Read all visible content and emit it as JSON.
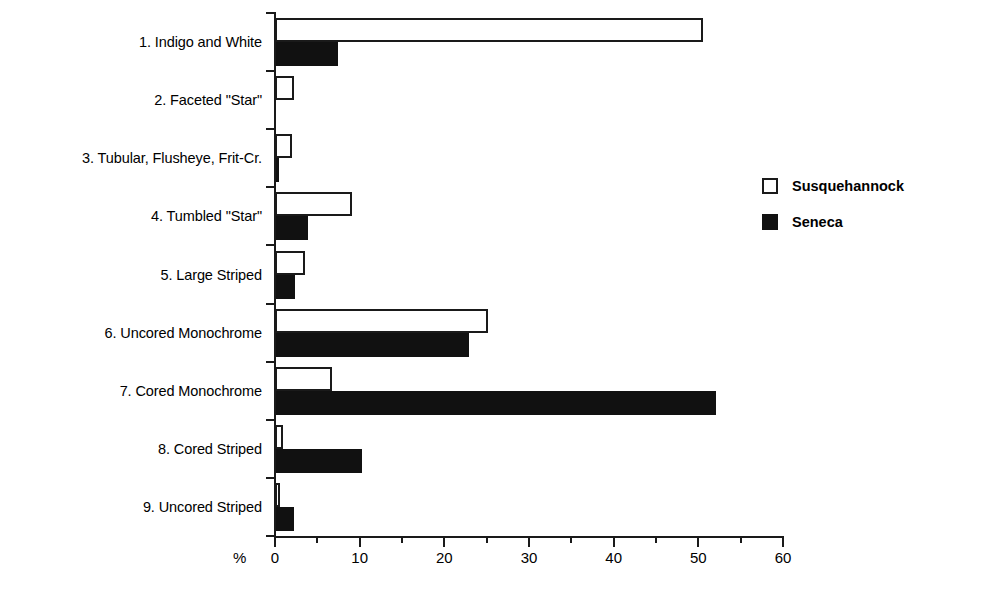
{
  "chart_data": {
    "type": "bar",
    "orientation": "horizontal",
    "title": "",
    "xlabel": "%",
    "ylabel": "",
    "xlim": [
      0,
      60
    ],
    "xticks": [
      0,
      10,
      20,
      30,
      40,
      50,
      60
    ],
    "xtick_labels": [
      "0",
      "10",
      "20",
      "30",
      "40",
      "50",
      "60"
    ],
    "minor_tick_step": 5,
    "grid": false,
    "legend_position": "right",
    "categories": [
      "1. Indigo and White",
      "2. Faceted \"Star\"",
      "3. Tubular, Flusheye, Frit-Cr.",
      "4. Tumbled \"Star\"",
      "5. Large Striped",
      "6. Uncored Monochrome",
      "7. Cored Monochrome",
      "8. Cored Striped",
      "9. Uncored Striped"
    ],
    "series": [
      {
        "name": "Susquehannock",
        "color": "#ffffff",
        "edge_color": "#1a1a1a",
        "values": [
          50.5,
          2.2,
          2.0,
          9.1,
          3.6,
          25.1,
          6.7,
          0.9,
          0.6
        ]
      },
      {
        "name": "Seneca",
        "color": "#111111",
        "edge_color": "#111111",
        "values": [
          7.4,
          0.0,
          0.5,
          3.9,
          2.4,
          22.9,
          52.1,
          10.3,
          2.2
        ]
      }
    ]
  },
  "axis": {
    "unit_label": "%"
  },
  "legend": {
    "items": [
      {
        "label": "Susquehannock",
        "marker": "hollow-square-icon"
      },
      {
        "label": "Seneca",
        "marker": "filled-square-icon"
      }
    ]
  }
}
